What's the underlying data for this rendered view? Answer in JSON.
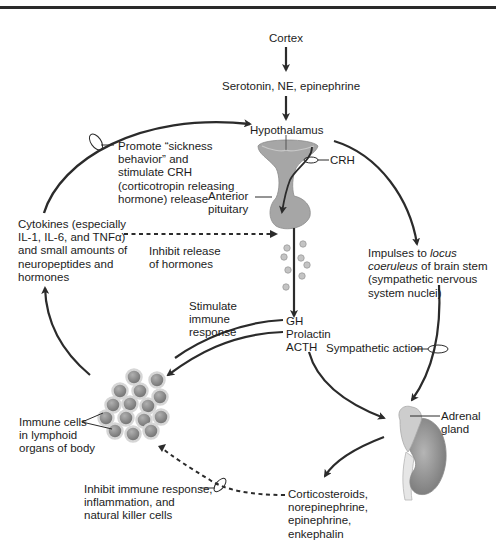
{
  "diagram": {
    "title_rule": true,
    "nodes": {
      "cortex": "Cortex",
      "neurotransmitters": "Serotonin, NE, epinephrine",
      "hypothalamus": "Hypothalamus",
      "crh": "CRH",
      "anterior_pituitary": [
        "Anterior",
        "pituitary"
      ],
      "cytokines": [
        "Cytokines (especially",
        "IL-1, IL-6, and TNFα)",
        "and small amounts of",
        "neuropeptides and",
        "hormones"
      ],
      "promote": [
        "Promote “sickness",
        "behavior” and",
        "stimulate CRH",
        "(corticotropin releasing",
        "hormone) release"
      ],
      "inhibit_release": [
        "Inhibit release",
        "of hormones"
      ],
      "locus": {
        "line1_prefix": "Impulses to ",
        "line1_italic": "locus",
        "line2_italic": "coeruleus",
        "line2_suffix": " of brain stem",
        "line3": "(sympathetic nervous",
        "line4": "system nuclei)"
      },
      "stimulate_immune": [
        "Stimulate",
        "immune",
        "response"
      ],
      "pituitary_hormones": [
        "GH",
        "Prolactin",
        "ACTH"
      ],
      "sympathetic_action": "Sympathetic action",
      "adrenal_gland": [
        "Adrenal",
        "gland"
      ],
      "immune_cells": [
        "Immune cells",
        "in lymphoid",
        "organs of body"
      ],
      "adrenal_outputs": [
        "Corticosteroids,",
        "norepinephrine,",
        "epinephrine,",
        "enkephalin"
      ],
      "inhibit_immune": [
        "Inhibit immune response,",
        "inflammation, and",
        "natural killer cells"
      ]
    },
    "colors": {
      "arrow": "#2b2b2b",
      "organ_fill": "#9c9c9c",
      "organ_light": "#c8c8c8",
      "cell_fill": "#8a8a8a",
      "granule": "#bdbdbd"
    }
  }
}
